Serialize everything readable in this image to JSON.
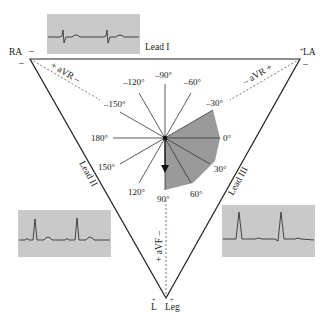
{
  "electrodes": {
    "ra": {
      "label": "RA",
      "polarity": "–"
    },
    "la": {
      "label": "LA",
      "polarity_top": "+",
      "polarity": "–"
    },
    "leg": {
      "label": "Leg",
      "left_label": "L",
      "polarity": "+"
    }
  },
  "leads": {
    "lead1": "Lead I",
    "lead2": "Lead II",
    "lead3": "Lead III",
    "avr_left": "+ aVR –",
    "avr_right": "– aVR +",
    "avf": "+ aVF –"
  },
  "angles": [
    {
      "label": "–90°",
      "deg": -90
    },
    {
      "label": "–60°",
      "deg": -60
    },
    {
      "label": "–30°",
      "deg": -30
    },
    {
      "label": "0°",
      "deg": 0
    },
    {
      "label": "30°",
      "deg": 30
    },
    {
      "label": "60°",
      "deg": 60
    },
    {
      "label": "90°",
      "deg": 90
    },
    {
      "label": "120°",
      "deg": 120
    },
    {
      "label": "150°",
      "deg": 150
    },
    {
      "label": "180°",
      "deg": 180
    },
    {
      "label": "–150°",
      "deg": -150
    },
    {
      "label": "–120°",
      "deg": -120
    }
  ],
  "normal_axis_range": {
    "from_deg": -30,
    "to_deg": 90
  },
  "mean_axis_arrow_deg": 90,
  "colors": {
    "line": "#222222",
    "wedge": "#9a9a9a",
    "ekg_background": "#c9c9c9"
  }
}
